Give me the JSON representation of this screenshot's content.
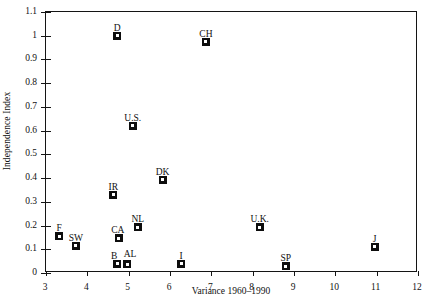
{
  "chart_data": {
    "type": "scatter",
    "title": "",
    "xlabel": "Variance 1960–1990",
    "ylabel": "Independence Index",
    "xlim": [
      3,
      12
    ],
    "ylim": [
      0,
      1.1
    ],
    "grid": false,
    "legend": "none",
    "xticks": [
      "3",
      "4",
      "5",
      "6",
      "7",
      "8",
      "9",
      "10",
      "11",
      "12"
    ],
    "xtick_values": [
      3,
      4,
      5,
      6,
      7,
      8,
      9,
      10,
      11,
      12
    ],
    "yticks": [
      "0",
      "0.1",
      "0.2",
      "0.3",
      "0.4",
      "0.5",
      "0.6",
      "0.7",
      "0.8",
      "0.9",
      "1",
      "1.1"
    ],
    "ytick_values": [
      0,
      0.1,
      0.2,
      0.3,
      0.4,
      0.5,
      0.6,
      0.7,
      0.8,
      0.9,
      1.0,
      1.1
    ],
    "marker": "filled-square-with-white-center",
    "points": [
      {
        "label": "D",
        "x": 4.72,
        "y": 1.0,
        "label_dx": 0,
        "label_dy": -13
      },
      {
        "label": "CH",
        "x": 6.87,
        "y": 0.975,
        "label_dx": 0,
        "label_dy": -13
      },
      {
        "label": "U.S.",
        "x": 5.1,
        "y": 0.62,
        "label_dx": 0,
        "label_dy": -13
      },
      {
        "label": "DK",
        "x": 5.82,
        "y": 0.393,
        "label_dx": 0,
        "label_dy": -13
      },
      {
        "label": "IR",
        "x": 4.63,
        "y": 0.33,
        "label_dx": 0,
        "label_dy": -13
      },
      {
        "label": "NL",
        "x": 5.22,
        "y": 0.193,
        "label_dx": 0,
        "label_dy": -13
      },
      {
        "label": "U.K.",
        "x": 8.17,
        "y": 0.193,
        "label_dx": 0,
        "label_dy": -13
      },
      {
        "label": "CA",
        "x": 4.76,
        "y": 0.147,
        "label_dx": -1,
        "label_dy": -13
      },
      {
        "label": "F",
        "x": 3.32,
        "y": 0.155,
        "label_dx": 0,
        "label_dy": -13
      },
      {
        "label": "SW",
        "x": 3.72,
        "y": 0.115,
        "label_dx": 0,
        "label_dy": -13
      },
      {
        "label": "J",
        "x": 10.95,
        "y": 0.11,
        "label_dx": 0,
        "label_dy": -13
      },
      {
        "label": "B",
        "x": 4.72,
        "y": 0.04,
        "label_dx": -3,
        "label_dy": -13
      },
      {
        "label": "AL",
        "x": 4.96,
        "y": 0.036,
        "label_dx": 3,
        "label_dy": -15
      },
      {
        "label": "I",
        "x": 6.27,
        "y": 0.038,
        "label_dx": 0,
        "label_dy": -13
      },
      {
        "label": "SP",
        "x": 8.8,
        "y": 0.028,
        "label_dx": 0,
        "label_dy": -13
      }
    ],
    "colors": {
      "marker": "#0d0d0d",
      "axis": "#141414",
      "text": "#111111",
      "background": "#ffffff"
    }
  }
}
